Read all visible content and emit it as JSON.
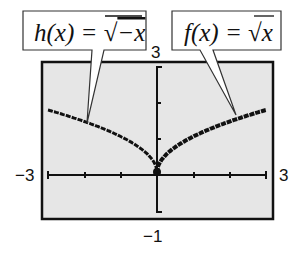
{
  "chart_data": {
    "type": "line",
    "title": "",
    "xlabel": "",
    "ylabel": "",
    "xlim": [
      -3,
      3
    ],
    "ylim": [
      -1,
      3
    ],
    "grid": false,
    "window_labels": {
      "xmin": "−3",
      "xmax": "3",
      "ymin": "−1",
      "ymax": "3"
    },
    "series": [
      {
        "name": "h(x) = √−x",
        "function": "sqrt(-x)",
        "domain": [
          -3,
          0
        ],
        "x": [
          -3,
          -2.5,
          -2,
          -1.5,
          -1,
          -0.5,
          -0.25,
          0
        ],
        "y": [
          1.73,
          1.58,
          1.41,
          1.22,
          1.0,
          0.71,
          0.5,
          0
        ]
      },
      {
        "name": "f(x) = √x",
        "function": "sqrt(x)",
        "domain": [
          0,
          3
        ],
        "x": [
          0,
          0.25,
          0.5,
          1,
          1.5,
          2,
          2.5,
          3
        ],
        "y": [
          0,
          0.5,
          0.71,
          1.0,
          1.22,
          1.41,
          1.58,
          1.73
        ]
      }
    ],
    "annotations": [
      {
        "text": "h(x) = √−x",
        "points_to": "left curve"
      },
      {
        "text": "f(x) = √x",
        "points_to": "right curve"
      }
    ],
    "legend_position": "callouts above plot"
  },
  "labels": {
    "left_callout_lhs": "h(x) = ",
    "left_callout_rad": "−x",
    "right_callout_lhs": "f(x) = ",
    "right_callout_rad": "x",
    "ymax": "3",
    "ymin": "−1",
    "xmin": "−3",
    "xmax": "3"
  },
  "colors": {
    "screen_bg": "#e6e6e6",
    "ink": "#111111"
  }
}
